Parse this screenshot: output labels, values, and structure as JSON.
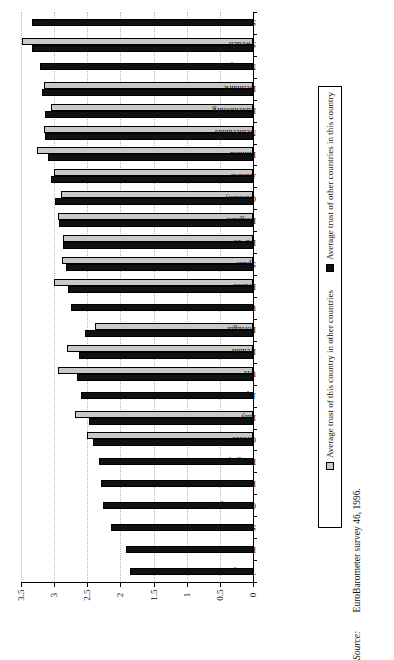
{
  "chart_data": {
    "type": "bar",
    "orientation": "horizontal",
    "title": "",
    "xlabel": "",
    "ylabel": "",
    "xlim": [
      0,
      3.5
    ],
    "xticks": [
      "3.5",
      "3",
      "2.5",
      "2",
      "1.5",
      "1",
      "0.5",
      "0"
    ],
    "xtick_values": [
      3.5,
      3,
      2.5,
      2,
      1.5,
      1,
      0.5,
      0
    ],
    "grid": true,
    "axis_direction": "value axis decreases left-to-right; 0 at right edge",
    "legend_position": "right, rotated 90 degrees",
    "categories": [
      "Switzerland",
      "Sweden",
      "Norway",
      "Denmark",
      "Luxembourg",
      "Netherlands",
      "Finland",
      "Austria",
      "Germany",
      "Belgium",
      "EU-15",
      "Spain",
      "France",
      "US",
      "Portugal",
      "Ireland",
      "UK",
      "Japan",
      "Italy",
      "Greece",
      "Hungary",
      "Poland",
      "Czech Republic",
      "Slovakia",
      "Russia",
      "Turkey"
    ],
    "series": [
      {
        "name": "Average trust of other countries in this country",
        "color": "#111111",
        "values": [
          3.34,
          3.33,
          3.22,
          3.19,
          3.14,
          3.14,
          3.1,
          3.04,
          2.99,
          2.93,
          2.86,
          2.82,
          2.79,
          2.75,
          2.53,
          2.62,
          2.66,
          2.6,
          2.47,
          2.42,
          2.33,
          2.29,
          2.27,
          2.14,
          1.92,
          1.86
        ]
      },
      {
        "name": "Average trust of this country in other countries",
        "color": "#c9c9c9",
        "values": [
          null,
          3.49,
          null,
          3.15,
          3.05,
          3.16,
          3.26,
          3.0,
          2.89,
          2.94,
          2.86,
          2.88,
          3.0,
          null,
          2.39,
          2.8,
          2.94,
          null,
          2.68,
          2.51,
          null,
          null,
          null,
          null,
          null,
          null
        ]
      }
    ]
  },
  "legend": {
    "items": [
      {
        "label": "Average trust of other countries in this country",
        "swatch": "black"
      },
      {
        "label": "Average trust of this country in other countries",
        "swatch": "gray"
      }
    ]
  },
  "source": {
    "label": "Source:",
    "text": "EuroBarometer survey 46, 1996."
  }
}
